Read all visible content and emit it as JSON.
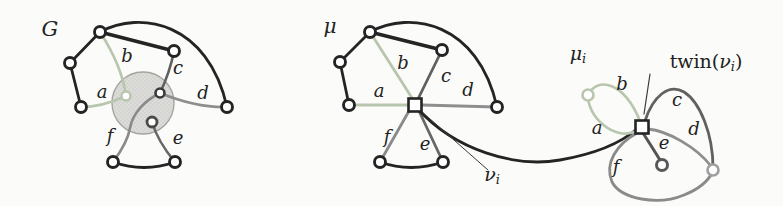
{
  "figure": {
    "width": 783,
    "height": 206,
    "background": "#fbfbf9"
  },
  "colors": {
    "ink": "#242424",
    "green": "#b9c6ae",
    "edge_c": "#616161",
    "edge_d": "#8e8e8e",
    "edge_e": "#676767",
    "edge_e_dark": "#555555",
    "edge_f": "#8a8a8a",
    "pointer": "#3a3a3a",
    "blob_fill": "#dcdcda",
    "blob_dot": "#c3c3c0",
    "blob_stroke": "#a3a3a0",
    "text": "#222222",
    "vertex_fill": "#ffffff",
    "inner_dark": "#3a3a3a",
    "inner_bottom": "#4a4a4a",
    "r_vertex": "#9e9e9e",
    "e_vertex": "#585858"
  },
  "blob": {
    "name": "contracted-subgraph-blob",
    "cx": 143,
    "cy": 103,
    "r": 31
  },
  "labels": [
    {
      "name": "graph-g-label",
      "x": 50,
      "y": 30,
      "size": 21,
      "parts": [
        {
          "t": "G"
        }
      ]
    },
    {
      "name": "g-edge-label-a",
      "x": 102,
      "y": 93,
      "size": 18,
      "parts": [
        {
          "t": "a"
        }
      ]
    },
    {
      "name": "g-edge-label-b",
      "x": 127,
      "y": 57,
      "size": 18,
      "parts": [
        {
          "t": "b"
        }
      ]
    },
    {
      "name": "g-edge-label-c",
      "x": 178,
      "y": 69,
      "size": 18,
      "parts": [
        {
          "t": "c"
        }
      ]
    },
    {
      "name": "g-edge-label-d",
      "x": 203,
      "y": 94,
      "size": 18,
      "parts": [
        {
          "t": "d"
        }
      ]
    },
    {
      "name": "g-edge-label-e",
      "x": 178,
      "y": 139,
      "size": 18,
      "parts": [
        {
          "t": "e"
        }
      ]
    },
    {
      "name": "g-edge-label-f",
      "x": 110,
      "y": 137,
      "size": 18,
      "parts": [
        {
          "t": "f"
        }
      ]
    },
    {
      "name": "mu-label",
      "x": 330,
      "y": 27,
      "size": 20,
      "parts": [
        {
          "t": "μ"
        }
      ]
    },
    {
      "name": "mu-edge-label-a",
      "x": 379,
      "y": 92,
      "size": 18,
      "parts": [
        {
          "t": "a"
        }
      ]
    },
    {
      "name": "mu-edge-label-b",
      "x": 403,
      "y": 64,
      "size": 18,
      "parts": [
        {
          "t": "b"
        }
      ]
    },
    {
      "name": "mu-edge-label-c",
      "x": 446,
      "y": 77,
      "size": 18,
      "parts": [
        {
          "t": "c"
        }
      ]
    },
    {
      "name": "mu-edge-label-d",
      "x": 468,
      "y": 91,
      "size": 18,
      "parts": [
        {
          "t": "d"
        }
      ]
    },
    {
      "name": "mu-edge-label-e",
      "x": 425,
      "y": 145,
      "size": 18,
      "parts": [
        {
          "t": "e"
        }
      ]
    },
    {
      "name": "mu-edge-label-f",
      "x": 387,
      "y": 138,
      "size": 18,
      "parts": [
        {
          "t": "f"
        }
      ]
    },
    {
      "name": "nu-i-label",
      "x": 492,
      "y": 176,
      "size": 19,
      "parts": [
        {
          "t": "ν"
        },
        {
          "t": "i",
          "sub": true
        }
      ]
    },
    {
      "name": "mu-i-label",
      "x": 578,
      "y": 55,
      "size": 19,
      "parts": [
        {
          "t": "μ"
        },
        {
          "t": "i",
          "sub": true
        }
      ]
    },
    {
      "name": "twin-nu-i-label",
      "x": 706,
      "y": 63,
      "size": 19,
      "parts": [
        {
          "t": "twin(",
          "up": true
        },
        {
          "t": "ν"
        },
        {
          "t": "i",
          "sub": true
        },
        {
          "t": ")",
          "up": true
        }
      ]
    },
    {
      "name": "mui-edge-label-a",
      "x": 597,
      "y": 129,
      "size": 18,
      "parts": [
        {
          "t": "a"
        }
      ]
    },
    {
      "name": "mui-edge-label-b",
      "x": 622,
      "y": 85,
      "size": 18,
      "parts": [
        {
          "t": "b"
        }
      ]
    },
    {
      "name": "mui-edge-label-c",
      "x": 677,
      "y": 101,
      "size": 18,
      "parts": [
        {
          "t": "c"
        }
      ]
    },
    {
      "name": "mui-edge-label-d",
      "x": 694,
      "y": 130,
      "size": 18,
      "parts": [
        {
          "t": "d"
        }
      ]
    },
    {
      "name": "mui-edge-label-e",
      "x": 664,
      "y": 144,
      "size": 18,
      "parts": [
        {
          "t": "e"
        }
      ]
    },
    {
      "name": "mui-edge-label-f",
      "x": 616,
      "y": 168,
      "size": 18,
      "parts": [
        {
          "t": "f"
        }
      ]
    }
  ],
  "edges": [
    {
      "name": "g-edge-top-upleft",
      "d": "M100,32 L70,63",
      "color": "ink",
      "w": 2.8
    },
    {
      "name": "g-edge-upleft-lowleft",
      "d": "M70,63 L81,107",
      "color": "ink",
      "w": 2.8
    },
    {
      "name": "g-edge-top-topright",
      "d": "M100,32 L174,51",
      "color": "ink",
      "w": 3.4
    },
    {
      "name": "g-edge-top-right-arc",
      "d": "M100,32 C140,10 208,22 227,107",
      "color": "ink",
      "w": 2.8
    },
    {
      "name": "g-edge-bottom-arc",
      "d": "M113,162 Q144,173 175,162",
      "color": "ink",
      "w": 2.8
    },
    {
      "name": "g-edge-a",
      "d": "M81,107 Q102,107 126,96",
      "color": "green",
      "w": 2.6
    },
    {
      "name": "g-edge-b",
      "d": "M100,32 Q122,66 126,96",
      "color": "green",
      "w": 2.6
    },
    {
      "name": "g-edge-c",
      "d": "M174,51 Q170,72 160,93",
      "color": "edge_c",
      "w": 2.6
    },
    {
      "name": "g-edge-d",
      "d": "M227,107 Q197,108 160,93",
      "color": "edge_d",
      "w": 2.6
    },
    {
      "name": "g-edge-e",
      "d": "M175,162 Q158,142 152,122",
      "color": "edge_e",
      "w": 2.6
    },
    {
      "name": "g-edge-f",
      "d": "M113,162 C122,150 128,140 130,128 C133,112 146,100 160,93",
      "color": "edge_f",
      "w": 2.6
    },
    {
      "name": "mu-edge-top-upleft",
      "d": "M370,32 L340,62",
      "color": "ink",
      "w": 2.8
    },
    {
      "name": "mu-edge-upleft-lowleft",
      "d": "M340,62 L349,105",
      "color": "ink",
      "w": 2.8
    },
    {
      "name": "mu-edge-top-topright",
      "d": "M370,32 L442,50",
      "color": "ink",
      "w": 3.4
    },
    {
      "name": "mu-edge-top-right-arc",
      "d": "M370,32 C410,10 478,22 497,107",
      "color": "ink",
      "w": 2.8
    },
    {
      "name": "mu-edge-bottom-arc",
      "d": "M380,162 Q411,173 443,162",
      "color": "ink",
      "w": 2.8
    },
    {
      "name": "mu-edge-a",
      "d": "M349,105 L408,105",
      "color": "green",
      "w": 2.8
    },
    {
      "name": "mu-edge-b",
      "d": "M370,32 L412,98",
      "color": "green",
      "w": 2.8
    },
    {
      "name": "mu-edge-c",
      "d": "M442,50 L418,99",
      "color": "edge_c",
      "w": 2.8
    },
    {
      "name": "mu-edge-d",
      "d": "M497,107 L422,105",
      "color": "edge_d",
      "w": 2.8
    },
    {
      "name": "mu-edge-e",
      "d": "M443,162 L419,111",
      "color": "edge_e",
      "w": 2.8
    },
    {
      "name": "mu-edge-f",
      "d": "M380,162 L409,111",
      "color": "edge_f",
      "w": 2.8
    },
    {
      "name": "virtual-edge-connector",
      "d": "M418,109 C455,150 515,168 560,160 C600,153 622,142 637,129",
      "color": "ink",
      "w": 2.8
    },
    {
      "name": "nu-i-pointer-line",
      "d": "M488,170 L421,111",
      "color": "pointer",
      "w": 1
    },
    {
      "name": "mui-edge-b",
      "d": "M588,95 C598,76 624,82 640,121",
      "color": "green",
      "w": 2.6
    },
    {
      "name": "mui-edge-a",
      "d": "M588,95 C587,116 614,142 637,131",
      "color": "green",
      "w": 2.6
    },
    {
      "name": "mui-edge-c",
      "d": "M645,121 C653,96 669,83 684,92 C700,102 713,134 713,168",
      "color": "edge_c",
      "w": 2.8
    },
    {
      "name": "mui-edge-d",
      "d": "M648,129 C668,131 696,147 711,166",
      "color": "edge_d",
      "w": 2.8
    },
    {
      "name": "mui-edge-e",
      "d": "M643,133 Q652,147 660,160",
      "color": "edge_e_dark",
      "w": 3
    },
    {
      "name": "mui-edge-f",
      "d": "M637,133 C617,144 604,163 612,182 C621,199 658,206 684,195 C699,189 708,181 712,173",
      "color": "edge_f",
      "w": 2.8
    },
    {
      "name": "twin-pointer-line",
      "d": "M650,74 L644,114",
      "color": "pointer",
      "w": 1.2
    }
  ],
  "vertices": [
    {
      "name": "g-vertex-top",
      "shape": "circle",
      "x": 100,
      "y": 32,
      "r": 5.5,
      "stroke": "ink",
      "sw": 2.9
    },
    {
      "name": "g-vertex-upper-left",
      "shape": "circle",
      "x": 70,
      "y": 63,
      "r": 5.5,
      "stroke": "ink",
      "sw": 2.9
    },
    {
      "name": "g-vertex-lower-left",
      "shape": "circle",
      "x": 81,
      "y": 107,
      "r": 5.5,
      "stroke": "ink",
      "sw": 2.9
    },
    {
      "name": "g-vertex-top-right",
      "shape": "circle",
      "x": 174,
      "y": 51,
      "r": 5.5,
      "stroke": "ink",
      "sw": 2.9
    },
    {
      "name": "g-vertex-right",
      "shape": "circle",
      "x": 227,
      "y": 107,
      "r": 5.5,
      "stroke": "ink",
      "sw": 2.9
    },
    {
      "name": "g-vertex-bottom-left",
      "shape": "circle",
      "x": 113,
      "y": 162,
      "r": 5.5,
      "stroke": "ink",
      "sw": 2.9
    },
    {
      "name": "g-vertex-bottom-right",
      "shape": "circle",
      "x": 175,
      "y": 162,
      "r": 5.5,
      "stroke": "ink",
      "sw": 2.9
    },
    {
      "name": "g-inner-vertex-light",
      "shape": "circle",
      "x": 126,
      "y": 96,
      "r": 4.5,
      "stroke": "green",
      "sw": 2.4
    },
    {
      "name": "g-inner-vertex-dark",
      "shape": "circle",
      "x": 160,
      "y": 93,
      "r": 4.5,
      "stroke": "inner_dark",
      "sw": 2.6
    },
    {
      "name": "g-inner-vertex-bottom",
      "shape": "circle",
      "x": 152,
      "y": 122,
      "r": 5,
      "stroke": "inner_bottom",
      "sw": 2.8
    },
    {
      "name": "mu-vertex-top",
      "shape": "circle",
      "x": 370,
      "y": 32,
      "r": 5.5,
      "stroke": "ink",
      "sw": 2.9
    },
    {
      "name": "mu-vertex-upper-left",
      "shape": "circle",
      "x": 340,
      "y": 62,
      "r": 5.5,
      "stroke": "ink",
      "sw": 2.9
    },
    {
      "name": "mu-vertex-lower-left",
      "shape": "circle",
      "x": 349,
      "y": 105,
      "r": 5.5,
      "stroke": "ink",
      "sw": 2.9
    },
    {
      "name": "mu-vertex-top-right",
      "shape": "circle",
      "x": 442,
      "y": 50,
      "r": 5.5,
      "stroke": "ink",
      "sw": 2.9
    },
    {
      "name": "mu-vertex-right",
      "shape": "circle",
      "x": 497,
      "y": 107,
      "r": 5.5,
      "stroke": "ink",
      "sw": 2.9
    },
    {
      "name": "mu-vertex-bottom-left",
      "shape": "circle",
      "x": 380,
      "y": 162,
      "r": 5.5,
      "stroke": "ink",
      "sw": 2.9
    },
    {
      "name": "mu-vertex-bottom-right",
      "shape": "circle",
      "x": 443,
      "y": 162,
      "r": 5.5,
      "stroke": "ink",
      "sw": 2.9
    },
    {
      "name": "nu-i-square-vertex",
      "shape": "square",
      "x": 415,
      "y": 105,
      "r": 6.5,
      "stroke": "ink",
      "sw": 2.6
    },
    {
      "name": "mui-vertex-light",
      "shape": "circle",
      "x": 588,
      "y": 95,
      "r": 5.5,
      "stroke": "green",
      "sw": 2.6
    },
    {
      "name": "twin-nu-i-square-vertex",
      "shape": "square",
      "x": 642,
      "y": 127,
      "r": 6.5,
      "stroke": "ink",
      "sw": 2.6
    },
    {
      "name": "mui-vertex-pendant",
      "shape": "circle",
      "x": 662,
      "y": 165,
      "r": 5.5,
      "stroke": "e_vertex",
      "sw": 3
    },
    {
      "name": "mui-vertex-right",
      "shape": "circle",
      "x": 713,
      "y": 170,
      "r": 5.5,
      "stroke": "r_vertex",
      "sw": 2.6
    }
  ]
}
